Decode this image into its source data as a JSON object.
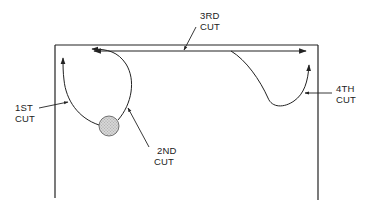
{
  "diagram": {
    "type": "cutting-sequence",
    "colors": {
      "line": "#222222",
      "hole_fill": "#c8c8c8",
      "background": "#ffffff"
    },
    "labels": {
      "cut1": {
        "line1": "1ST",
        "line2": "CUT"
      },
      "cut2": {
        "line1": "2ND",
        "line2": "CUT"
      },
      "cut3": {
        "line1": "3RD",
        "line2": "CUT"
      },
      "cut4": {
        "line1": "4TH",
        "line2": "CUT"
      }
    },
    "elements": {
      "frame": "workpiece-outline",
      "hole": "start-hole",
      "cut1_path": "curve from hole up to left edge",
      "cut2_path": "curve from hole around to top edge",
      "cut3_path": "straight cut along top edge, bidirectional",
      "cut4_path": "curve from top edge down and up to right edge"
    }
  }
}
